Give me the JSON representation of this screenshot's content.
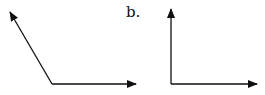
{
  "labels": {
    "b": "b."
  },
  "figures": [
    {
      "name": "obtuse-angle",
      "vertex": [
        52,
        84
      ],
      "ray1_end": [
        9,
        11
      ],
      "ray2_end": [
        136,
        84
      ]
    },
    {
      "name": "right-angle",
      "vertex": [
        171,
        84
      ],
      "ray1_end": [
        171,
        9
      ],
      "ray2_end": [
        257,
        84
      ]
    }
  ],
  "colors": {
    "stroke": "#111111"
  }
}
